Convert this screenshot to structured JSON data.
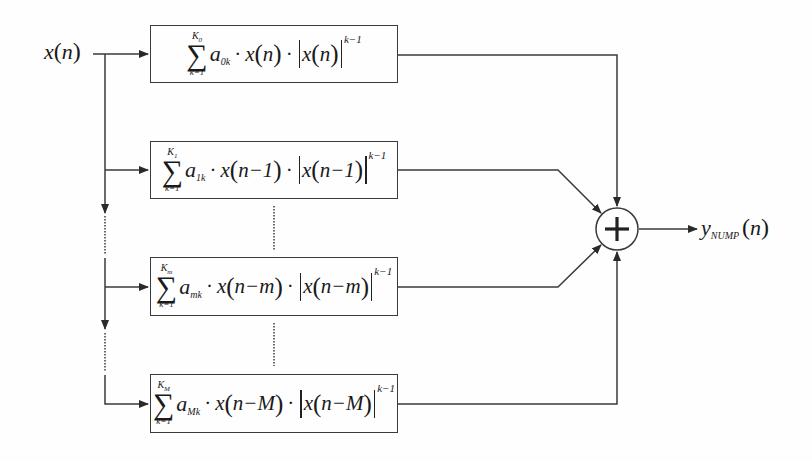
{
  "diagram": {
    "type": "block-diagram",
    "title": "",
    "input": {
      "var": "x",
      "arg": "n"
    },
    "output": {
      "var": "y",
      "sub": "NUMP",
      "arg": "n"
    },
    "summing_node": {
      "symbol": "+"
    },
    "branches": [
      {
        "upper": "K",
        "upper_sub": "0",
        "lower": "k=1",
        "coef": "a",
        "coef_sub": "0k",
        "arg": "n",
        "exp": "k−1"
      },
      {
        "upper": "K",
        "upper_sub": "1",
        "lower": "k=1",
        "coef": "a",
        "coef_sub": "1k",
        "arg": "n−1",
        "exp": "k−1"
      },
      {
        "upper": "K",
        "upper_sub": "m",
        "lower": "k=1",
        "coef": "a",
        "coef_sub": "mk",
        "arg": "n−m",
        "exp": "k−1"
      },
      {
        "upper": "K",
        "upper_sub": "M",
        "lower": "k=1",
        "coef": "a",
        "coef_sub": "Mk",
        "arg": "n−M",
        "exp": "k−1"
      }
    ],
    "colors": {
      "line": "#3a3a3a",
      "text": "#1a1a1a",
      "background": "#fefefe"
    }
  }
}
